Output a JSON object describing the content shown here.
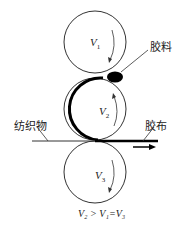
{
  "diagram": {
    "labels": {
      "glue": "胶料",
      "fabric": "纺织物",
      "rubber_cloth": "胶布"
    },
    "rollers": [
      {
        "name": "V",
        "sub": "1"
      },
      {
        "name": "V",
        "sub": "2"
      },
      {
        "name": "V",
        "sub": "3"
      }
    ],
    "formula": "V₂ > V₁=V₃"
  }
}
